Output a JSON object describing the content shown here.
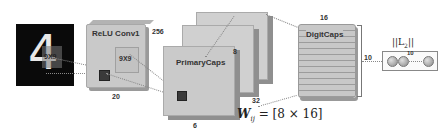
{
  "diagram": {
    "input_image": {
      "digit": "4",
      "kernel_label": "9X9"
    },
    "relu_conv1": {
      "label": "ReLU Conv1",
      "kernel_label": "9X9",
      "depth": "256",
      "width": "20"
    },
    "primary_caps": {
      "label": "PrimaryCaps",
      "dim": "8",
      "channels": "32",
      "width": "6"
    },
    "weight_label": "W",
    "weight_subscript": "ij",
    "weight_formula": " = [8 × 16]",
    "digit_caps": {
      "label": "DigitCaps",
      "width": "16",
      "count": "10"
    },
    "output": {
      "norm_label_pre": "||L",
      "norm_sub": "2",
      "norm_label_post": "||",
      "count": "10"
    },
    "colors": {
      "box_fill": "#c9c9c9",
      "box_border": "#a8a8a8",
      "image_bg": "#0a0a0a",
      "text": "#333333"
    }
  }
}
